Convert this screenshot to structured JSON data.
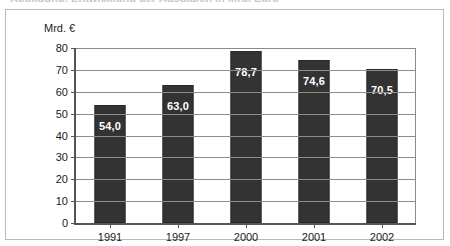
{
  "cutoff_title": "Abbildung: Entwicklung der Ausgaben in Mrd. Euro",
  "chart_data": {
    "type": "bar",
    "title": "",
    "subtitle": "",
    "xlabel": "",
    "ylabel": "Mrd. €",
    "unit_label": "Mrd. €",
    "categories": [
      "1991",
      "1997",
      "2000",
      "2001",
      "2002"
    ],
    "values": [
      54.0,
      63.0,
      78.7,
      74.6,
      70.5
    ],
    "value_labels": [
      "54,0",
      "63,0",
      "78,7",
      "74,6",
      "70,5"
    ],
    "ylim": [
      0,
      80
    ],
    "ytick_labels": [
      "0",
      "10",
      "20",
      "30",
      "40",
      "50",
      "60",
      "70",
      "80"
    ],
    "ytick_values": [
      0,
      10,
      20,
      30,
      40,
      50,
      60,
      70,
      80
    ],
    "grid": true,
    "grid_orientation": "horizontal",
    "legend": false,
    "legend_position": "none",
    "series": [
      {
        "name": "Mrd. €",
        "values": [
          54.0,
          63.0,
          78.7,
          74.6,
          70.5
        ]
      }
    ]
  },
  "colors": {
    "bar_fill": "#333333",
    "bar_border": "#2a2a2a",
    "value_label": "#ffffff",
    "gridline": "#8c8c8c",
    "axis_line": "#555555",
    "frame": "#b9b9b9",
    "background": "#ffffff",
    "text": "#1a1a1a"
  }
}
